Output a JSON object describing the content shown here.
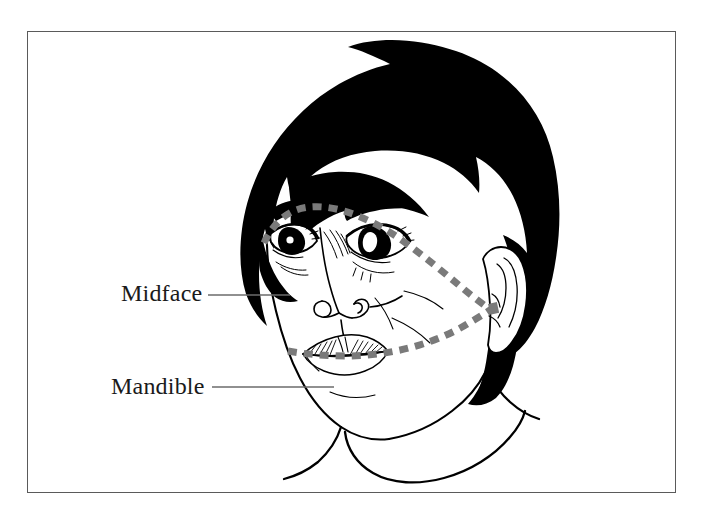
{
  "figure": {
    "type": "anatomical-illustration",
    "background_color": "#ffffff",
    "frame_color": "#5a5a5a",
    "ink_color": "#000000",
    "dash_color": "#7a7a7a",
    "leader_color": "#6b6b6b"
  },
  "labels": [
    {
      "id": "midface",
      "text": "Midface",
      "leader": {
        "from_x": 208,
        "to_x": 290,
        "y": 295
      }
    },
    {
      "id": "mandible",
      "text": "Mandible",
      "leader": {
        "from_x": 212,
        "to_x": 334,
        "y": 387
      }
    }
  ],
  "regions": {
    "midface": {
      "name": "Midface",
      "description": "Dashed boundary arcing from the left cheek over the brows, down past the ear to the mouth line"
    },
    "mandible": {
      "name": "Mandible",
      "description": "Dashed boundary running along the mouth line from the left cheek back to the ear"
    }
  },
  "drawing_features": [
    "black-bob-hair",
    "left-eye",
    "right-eye",
    "eyebrows",
    "nose",
    "nostrils",
    "hatched-upper-lip",
    "lower-lip",
    "chin",
    "jawline",
    "ear",
    "neck",
    "collar"
  ]
}
